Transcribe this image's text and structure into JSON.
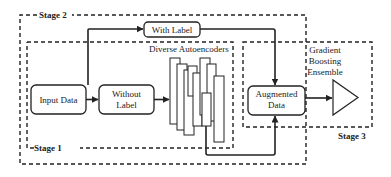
{
  "stages": {
    "stage1": "Stage 1",
    "stage2": "Stage 2",
    "stage3": "Stage 3"
  },
  "nodes": {
    "input_data": "Input Data",
    "without_label_1": "Without",
    "without_label_2": "Label",
    "with_label": "With Label",
    "autoencoders": "Diverse Autoencoders",
    "augmented_1": "Augmented",
    "augmented_2": "Data",
    "gbe_1": "Gradient",
    "gbe_2": "Boosting",
    "gbe_3": "Ensemble"
  },
  "colors": {
    "line": "#222222",
    "background": "#ffffff"
  }
}
